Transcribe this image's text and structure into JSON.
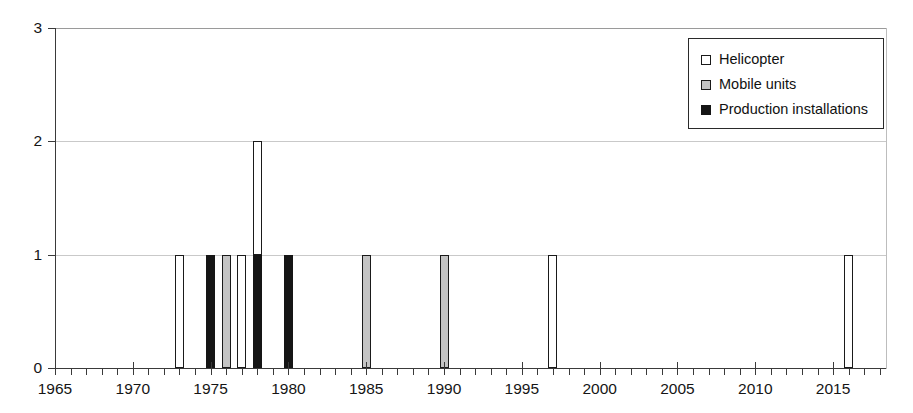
{
  "chart_data": {
    "type": "bar",
    "title": "",
    "subtitle": "",
    "xlabel": "",
    "ylabel": "",
    "xlim": [
      1965,
      2018.4
    ],
    "ylim": [
      0,
      3
    ],
    "y_ticks": [
      "0",
      "1",
      "2",
      "3"
    ],
    "y_tick_values": [
      0,
      1,
      2,
      3
    ],
    "x_ticks": [
      "1965",
      "1970",
      "1975",
      "1980",
      "1985",
      "1990",
      "1995",
      "2000",
      "2005",
      "2010",
      "2015"
    ],
    "x_tick_values": [
      1965,
      1970,
      1975,
      1980,
      1985,
      1990,
      1995,
      2000,
      2005,
      2010,
      2015
    ],
    "x_minor_tick_interval": 1,
    "grid": true,
    "stacked": true,
    "legend_position": "top-right",
    "series": [
      {
        "name": "Helicopter",
        "color": "#ffffff",
        "points": [
          {
            "x": 1973,
            "y": 1,
            "base": 0
          },
          {
            "x": 1977,
            "y": 1,
            "base": 0
          },
          {
            "x": 1978,
            "y": 1,
            "base": 1
          },
          {
            "x": 1997,
            "y": 1,
            "base": 0
          },
          {
            "x": 2016,
            "y": 1,
            "base": 0
          }
        ]
      },
      {
        "name": "Mobile units",
        "color": "#c4c4c4",
        "points": [
          {
            "x": 1976,
            "y": 1,
            "base": 0
          },
          {
            "x": 1985,
            "y": 1,
            "base": 0
          },
          {
            "x": 1990,
            "y": 1,
            "base": 0
          }
        ]
      },
      {
        "name": "Production installations",
        "color": "#151515",
        "points": [
          {
            "x": 1975,
            "y": 1,
            "base": 0
          },
          {
            "x": 1978,
            "y": 1,
            "base": 0
          },
          {
            "x": 1980,
            "y": 1,
            "base": 0
          }
        ]
      }
    ],
    "totals_by_year": [
      {
        "x": 1973,
        "total": 1
      },
      {
        "x": 1975,
        "total": 1
      },
      {
        "x": 1976,
        "total": 1
      },
      {
        "x": 1977,
        "total": 1
      },
      {
        "x": 1978,
        "total": 2
      },
      {
        "x": 1980,
        "total": 1
      },
      {
        "x": 1985,
        "total": 1
      },
      {
        "x": 1990,
        "total": 1
      },
      {
        "x": 1997,
        "total": 1
      },
      {
        "x": 2016,
        "total": 1
      }
    ]
  },
  "legend": {
    "items": [
      {
        "label": "Helicopter",
        "swatch": "white-square-icon",
        "series_class": "series-helicopter"
      },
      {
        "label": "Mobile units",
        "swatch": "gray-square-icon",
        "series_class": "series-mobile"
      },
      {
        "label": "Production installations",
        "swatch": "black-square-icon",
        "series_class": "series-production"
      }
    ]
  },
  "colors": {
    "helicopter": "#ffffff",
    "mobile_units": "#c4c4c4",
    "production_installations": "#151515",
    "axis": "#3a3a3a",
    "grid": "#c9c9c9",
    "background": "#ffffff"
  }
}
